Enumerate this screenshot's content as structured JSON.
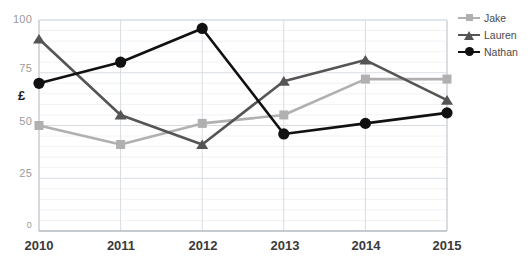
{
  "chart_data": {
    "type": "line",
    "title": "",
    "xlabel": "",
    "ylabel": "£",
    "categories": [
      "2010",
      "2011",
      "2012",
      "2013",
      "2014",
      "2015"
    ],
    "x": [
      2010,
      2011,
      2012,
      2013,
      2014,
      2015
    ],
    "ylim": [
      0,
      100
    ],
    "yticks": [
      0,
      25,
      50,
      75,
      100
    ],
    "ytick_labels": [
      "0",
      "25",
      "50",
      "75",
      "100"
    ],
    "grid": true,
    "legend_position": "right",
    "series": [
      {
        "name": "Jake",
        "color": "#b0b0b0",
        "marker": "square",
        "values": [
          50,
          41,
          51,
          55,
          72,
          72
        ]
      },
      {
        "name": "Lauren",
        "color": "#555555",
        "marker": "triangle",
        "values": [
          91,
          55,
          41,
          71,
          81,
          62
        ]
      },
      {
        "name": "Nathan",
        "color": "#111111",
        "marker": "circle",
        "values": [
          70,
          80,
          96,
          46,
          51,
          56
        ]
      }
    ]
  },
  "axes": {
    "y_ticks": [
      {
        "label": "100",
        "value": 100
      },
      {
        "label": "75",
        "value": 75
      },
      {
        "label": "50",
        "value": 50
      },
      {
        "label": "25",
        "value": 25
      },
      {
        "label": "0",
        "value": 0
      }
    ],
    "y_axis_title": "£",
    "x_ticks": [
      {
        "label": "2010"
      },
      {
        "label": "2011"
      },
      {
        "label": "2012"
      },
      {
        "label": "2013"
      },
      {
        "label": "2014"
      },
      {
        "label": "2015"
      }
    ]
  },
  "legend": {
    "items": [
      {
        "label": "Jake",
        "color": "#b0b0b0",
        "marker": "square"
      },
      {
        "label": "Lauren",
        "color": "#555555",
        "marker": "triangle"
      },
      {
        "label": "Nathan",
        "color": "#111111",
        "marker": "circle"
      }
    ]
  },
  "colors": {
    "plot_background": "#ffffff",
    "grid_major": "#d8dde2",
    "grid_minor": "#f0f2f4",
    "axis_line": "#c8cdd2",
    "tick_text": "#9a9a9a",
    "x_label_text": "#3a3a3a"
  }
}
